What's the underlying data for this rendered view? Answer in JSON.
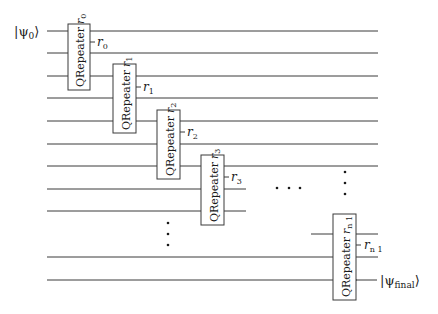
{
  "diagram": {
    "type": "quantum-circuit",
    "input_state": {
      "label": "|ψ",
      "sub": "0",
      "close": "⟩"
    },
    "output_state": {
      "label": "|ψ",
      "sub": "final",
      "close": "⟩"
    },
    "gate_name": "QRepeater",
    "gates": [
      {
        "name": "QRepeater",
        "param": "r",
        "sub": "0",
        "output": "r",
        "output_sub": "0"
      },
      {
        "name": "QRepeater",
        "param": "r",
        "sub": "1",
        "output": "r",
        "output_sub": "1"
      },
      {
        "name": "QRepeater",
        "param": "r",
        "sub": "2",
        "output": "r",
        "output_sub": "2"
      },
      {
        "name": "QRepeater",
        "param": "r",
        "sub": "3",
        "output": "r",
        "output_sub": "3"
      },
      {
        "name": "QRepeater",
        "param": "r",
        "sub": "n 1",
        "output": "r",
        "output_sub": "n 1"
      }
    ],
    "ellipsis_horizontal": "· · ·",
    "ellipsis_vertical": "⋮"
  },
  "colors": {
    "line": "#3a3a3a",
    "text": "#1a1a1a",
    "background": "#ffffff"
  }
}
